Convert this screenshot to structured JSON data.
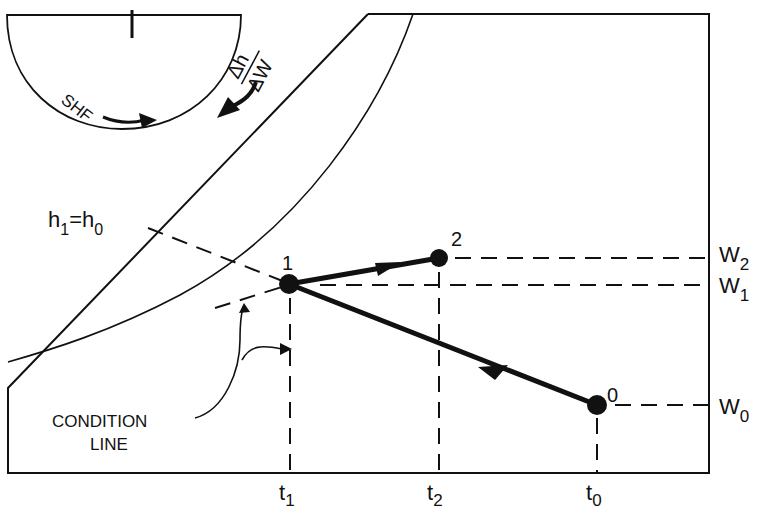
{
  "diagram": {
    "colors": {
      "ink": "#111111",
      "background": "#ffffff"
    },
    "protractor": {
      "shf_label": "SHF",
      "slope_label_num": "Δh",
      "slope_label_den": "ΔW"
    },
    "enthalpy_label": {
      "h": "h",
      "sub1": "1",
      "eq": "=h",
      "sub0": "0"
    },
    "points": [
      {
        "id": "0",
        "label": "0"
      },
      {
        "id": "1",
        "label": "1"
      },
      {
        "id": "2",
        "label": "2"
      }
    ],
    "humidity_ratio_labels": [
      {
        "base": "W",
        "sub": "2"
      },
      {
        "base": "W",
        "sub": "1"
      },
      {
        "base": "W",
        "sub": "0"
      }
    ],
    "temperature_labels": [
      {
        "base": "t",
        "sub": "1"
      },
      {
        "base": "t",
        "sub": "2"
      },
      {
        "base": "t",
        "sub": "0"
      }
    ],
    "callout": {
      "line1": "CONDITION",
      "line2": "LINE"
    }
  }
}
